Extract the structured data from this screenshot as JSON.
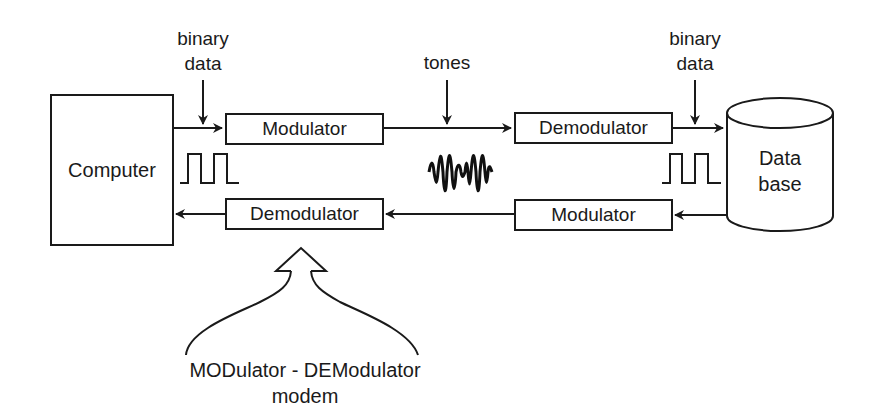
{
  "diagram": {
    "computer": {
      "label": "Computer"
    },
    "database": {
      "label_line1": "Data",
      "label_line2": "base"
    },
    "top_path": {
      "modulator": "Modulator",
      "demodulator": "Demodulator"
    },
    "bottom_path": {
      "demodulator": "Demodulator",
      "modulator": "Modulator"
    },
    "annotations": {
      "binary_data_left_line1": "binary",
      "binary_data_left_line2": "data",
      "tones": "tones",
      "binary_data_right_line1": "binary",
      "binary_data_right_line2": "data"
    },
    "caption": {
      "line1": "MODulator - DEModulator",
      "line2": "modem"
    },
    "icons": [
      "square-wave-icon",
      "tone-waveform-icon",
      "square-wave-icon",
      "hollow-up-arrow-icon",
      "database-cylinder-icon"
    ],
    "colors": {
      "stroke": "#1a1a1a",
      "background": "#ffffff"
    }
  }
}
